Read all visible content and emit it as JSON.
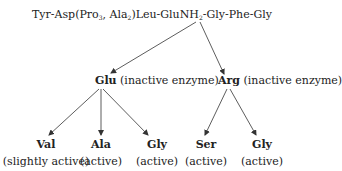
{
  "diagram": {
    "root": {
      "parts": [
        "Tyr-Asp(Pro",
        "3",
        ", Ala",
        "2",
        ")Leu-GluNH",
        "2",
        "-Gly-Phe-Gly"
      ],
      "full_text": "Tyr-Asp(Pro3, Ala2)Leu-GluNH2-Gly-Phe-Gly"
    },
    "level1": [
      {
        "residue": "Glu",
        "activity": "(inactive enzyme)"
      },
      {
        "residue": "Arg",
        "activity": "(inactive enzyme)"
      }
    ],
    "level2": [
      {
        "parent": "Glu",
        "residue": "Val",
        "activity": "(slightly active)"
      },
      {
        "parent": "Glu",
        "residue": "Ala",
        "activity": "(active)"
      },
      {
        "parent": "Glu",
        "residue": "Gly",
        "activity": "(active)"
      },
      {
        "parent": "Arg",
        "residue": "Ser",
        "activity": "(active)"
      },
      {
        "parent": "Arg",
        "residue": "Gly",
        "activity": "(active)"
      }
    ],
    "colors": {
      "text": "#222222",
      "arrow": "#333333",
      "background": "#ffffff"
    }
  }
}
